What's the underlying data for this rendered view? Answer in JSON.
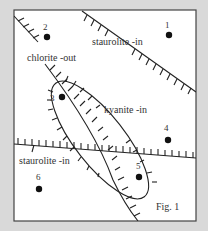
{
  "figure": {
    "caption": "Fig. 1",
    "background": "#d9d9d9",
    "frame_fill": "#ffffff",
    "line_color": "#222222"
  },
  "labels": {
    "staurolite_in_upper": "staurolite -in",
    "chlorite_out": "chlorite -out",
    "kyanite_in": "kyanite -in",
    "staurolite_in_lower": "staurolite -in"
  },
  "points": [
    {
      "id": "1",
      "label": "1"
    },
    {
      "id": "2",
      "label": "2"
    },
    {
      "id": "3",
      "label": "3"
    },
    {
      "id": "4",
      "label": "4"
    },
    {
      "id": "5",
      "label": "5"
    },
    {
      "id": "6",
      "label": "6"
    }
  ]
}
